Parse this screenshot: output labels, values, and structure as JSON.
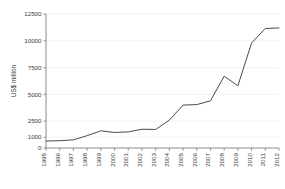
{
  "chart_data": {
    "type": "line",
    "title": "",
    "subtitle": "",
    "xlabel": "",
    "ylabel": "US$ million",
    "x": [
      1995,
      1996,
      1997,
      1998,
      1999,
      2000,
      2001,
      2002,
      2003,
      2004,
      2005,
      2006,
      2007,
      2008,
      2009,
      2010,
      2011,
      2012
    ],
    "xtick_labels": [
      "1995",
      "1996",
      "1997",
      "1998",
      "1999",
      "2000",
      "2001",
      "2002",
      "2003",
      "2004",
      "2005",
      "2006",
      "2007",
      "2008",
      "2009",
      "2010",
      "2011",
      "2012"
    ],
    "series": [
      {
        "name": "US$ million",
        "values": [
          650,
          680,
          760,
          1150,
          1600,
          1450,
          1500,
          1750,
          1730,
          2600,
          4000,
          4050,
          4400,
          6700,
          5800,
          9800,
          11150,
          11200
        ],
        "color": "#4a4a4a"
      }
    ],
    "ytick_values": [
      0,
      1000,
      2500,
      5000,
      7500,
      10000,
      12500
    ],
    "ytick_labels": [
      "0",
      "1000",
      "2500",
      "5000",
      "7500",
      "10000",
      "12500"
    ],
    "ylim": [
      0,
      12500
    ],
    "xlim": [
      1995,
      2012
    ],
    "grid": true,
    "grid_axis": "y",
    "legend": false,
    "legend_position": "none",
    "gridline_color": "#e9e9ec",
    "axis_color": "#6e6e6e",
    "background_color": "#ffffff",
    "text_color": "#3a3a3a"
  }
}
